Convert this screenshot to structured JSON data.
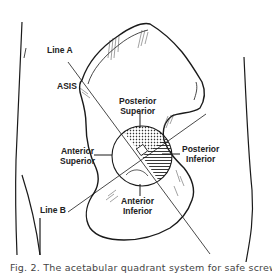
{
  "figure": {
    "labels": {
      "line_a": "Line A",
      "asis": "ASIS",
      "posterior_superior_1": "Posterior",
      "posterior_superior_2": "Superior",
      "anterior_superior_1": "Anterior",
      "anterior_superior_2": "Superior",
      "posterior_inferior_1": "Posterior",
      "posterior_inferior_2": "Inferior",
      "anterior_inferior_1": "Anterior",
      "anterior_inferior_2": "Inferior",
      "line_b": "Line B"
    },
    "caption": "Fig. 2. The acetabular quadrant system for safe screw"
  },
  "colors": {
    "ink": "#1a1a1a",
    "background": "#ffffff",
    "caption": "#444444"
  }
}
